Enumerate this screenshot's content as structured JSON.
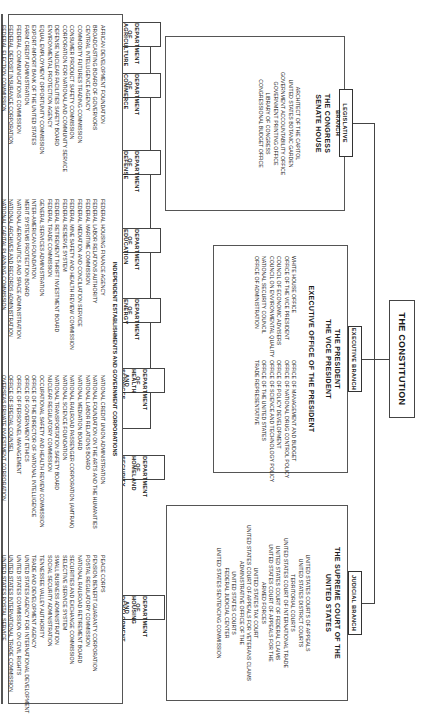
{
  "title": "THE CONSTITUTION",
  "branches": {
    "legislative": {
      "label": "LEGISLATIVE BRANCH",
      "heads": [
        "THE CONGRESS",
        "SENATE   HOUSE"
      ],
      "agencies": [
        "ARCHITECT OF THE CAPITOL",
        "UNITED STATES BOTANIC GARDEN",
        "GOVERNMENT ACCOUNTABILITY OFFICE",
        "GOVERNMENT PRINTING OFFICE",
        "LIBRARY OF CONGRESS",
        "CONGRESSIONAL BUDGET OFFICE"
      ]
    },
    "executive": {
      "label": "EXECUTIVE BRANCH",
      "heads": [
        "THE PRESIDENT",
        "THE VICE PRESIDENT"
      ],
      "eop_header": "EXECUTIVE OFFICE OF THE PRESIDENT",
      "eop_left": [
        "WHITE HOUSE OFFICE",
        "OFFICE OF THE VICE PRESIDENT",
        "COUNCIL OF ECONOMIC ADVISERS",
        "COUNCIL ON ENVIRONMENTAL QUALITY",
        "NATIONAL SECURITY COUNCIL",
        "OFFICE OF ADMINISTRATION"
      ],
      "eop_right": [
        "OFFICE OF MANAGEMENT AND BUDGET",
        "OFFICE OF NATIONAL DRUG CONTROL POLICY",
        "OFFICE OF POLICY DEVELOPMENT",
        "OFFICE OF SCIENCE AND TECHNOLOGY POLICY",
        "OFFICE OF THE UNITED STATES",
        "TRADE REPRESENTATIVE"
      ]
    },
    "judicial": {
      "label": "JUDICIAL BRANCH",
      "heads": [
        "THE SUPREME COURT OF THE",
        "UNITED STATES"
      ],
      "courts": [
        "UNITED STATES COURTS OF APPEALS",
        "UNITED STATES DISTRICT COURTS",
        "TERRITORIAL COURTS",
        "UNITED STATES COURT OF INTERNATIONAL TRADE",
        "UNITED STATES COURT OF FEDERAL CLAIMS",
        "UNITED STATES COURT OF APPEALS FOR THE",
        "ARMED FORCES",
        "UNITED STATES TAX COURT",
        "UNITED STATES COURT OF APPEALS FOR VETERANS CLAIMS",
        "ADMINISTRATIVE OFFICE OF THE",
        "UNITED STATES COURTS",
        "FEDERAL JUDICIAL CENTER",
        "UNITED STATES SENTENCING COMMISSION"
      ]
    }
  },
  "departments_row1": [
    {
      "l1": "DEPARTMENT OF",
      "l2": "AGRICULTURE"
    },
    {
      "l1": "DEPARTMENT OF",
      "l2": "COMMERCE"
    },
    {
      "l1": "DEPARTMENT OF",
      "l2": "DEFENSE"
    },
    {
      "l1": "DEPARTMENT OF",
      "l2": "EDUCATION"
    },
    {
      "l1": "DEPARTMENT OF",
      "l2": "ENERGY"
    },
    {
      "l1": "DEPARTMENT OF",
      "l2": "HEALTH AND HUMAN",
      "l3": "SERVICES"
    },
    {
      "l1": "DEPARTMENT OF",
      "l2": "HOMELAND",
      "l3": "SECURITY"
    },
    {
      "l1": "DEPARTMENT OF",
      "l2": "HOUSING AND URBAN",
      "l3": "DEVELOPMENT"
    }
  ],
  "departments_row2": [
    {
      "l1": "DEPARTMENT OF",
      "l2": "THE INTERIOR"
    },
    {
      "l1": "DEPARTMENT OF",
      "l2": "JUSTICE"
    },
    {
      "l1": "DEPARTMENT OF",
      "l2": "LABOR"
    },
    {
      "l1": "DEPARTMENT OF",
      "l2": "STATE"
    },
    {
      "l1": "DEPARTMENT OF",
      "l2": "TRANSPORTATION"
    },
    {
      "l1": "DEPARTMENT OF",
      "l2": "THE TREASURY"
    },
    {
      "l1": "DEPARTMENT OF",
      "l2": "VETERANS AFFAIRS"
    }
  ],
  "independent": {
    "header": "INDEPENDENT ESTABLISHMENTS AND GOVERNMENT CORPORATIONS",
    "col1": [
      "AFRICAN DEVELOPMENT FOUNDATION",
      "BROADCASTING BOARD OF GOVERNORS",
      "CENTRAL INTELLIGENCE AGENCY",
      "COMMODITY FUTURES TRADING COMMISSION",
      "CONSUMER PRODUCT SAFETY COMMISSION",
      "CORPORATION FOR NATIONAL AND COMMUNITY SERVICE",
      "DEFENSE NUCLEAR FACILITIES SAFETY BOARD",
      "ENVIRONMENTAL PROTECTION AGENCY",
      "EQUAL EMPLOYMENT OPPORTUNITY COMMISSION",
      "EXPORT-IMPORT BANK OF THE UNITED STATES",
      "FARM CREDIT ADMINISTRATION",
      "FEDERAL COMMUNICATIONS COMMISSION",
      "FEDERAL DEPOSIT INSURANCE CORPORATION",
      "FEDERAL ELECTION COMMISSION"
    ],
    "col2": [
      "FEDERAL HOUSING FINANCE  AGENCY",
      "FEDERAL LABOR RELATIONS AUTHORITY",
      "FEDERAL MARITIME COMMISSION",
      "FEDERAL MEDIATION AND CONCILIATION SERVICE",
      "FEDERAL MINE SAFETY AND HEALTH REVIEW COMMISSION",
      "FEDERAL RESERVE SYSTEM",
      "FEDERAL RETIREMENT THRIFT INVESTMENT BOARD",
      "FEDERAL TRADE COMMISSION",
      "GENERAL SERVICES ADMINISTRATION",
      "INTER-AMERICAN FOUNDATION",
      "MERIT SYSTEMS PROTECTION BOARD",
      "NATIONAL AERONAUTICS AND SPACE ADMINISTRATION",
      "NATIONAL ARCHIVES AND RECORDS ADMINISTRATION",
      "NATIONAL CAPITAL PLANNING COMMISSION"
    ],
    "col3": [
      "NATIONAL CREDIT UNION ADMINISTRATION",
      "NATIONAL FOUNDATION ON THE ARTS AND THE HUMANITIES",
      "NATIONAL LABOR RELATIONS BOARD",
      "NATIONAL MEDIATION BOARD",
      "NATIONAL RAILROAD PASSENGER CORPORATION (AMTRAK)",
      "NATIONAL SCIENCE FOUNDATION",
      "NATIONAL TRANSPORTATION SAFETY BOARD",
      "NUCLEAR REGULATORY COMMISSION",
      "OCCUPATIONAL SAFETY AND HEALTH REVIEW COMMISSION",
      "OFFICE OF THE DIRECTOR OF NATIONAL INTELLIGENCE",
      "OFFICE OF GOVERNMENT ETHICS",
      "OFFICE OF PERSONNEL MANAGEMENT",
      "OFFICE OF SPECIAL COUNSEL",
      "OVERSEAS PRIVATE INVESTMENT CORPORATION"
    ],
    "col4": [
      "PEACE CORPS",
      "PENSION BENEFIT GUARANTY CORPORATION",
      "POSTAL REGULATORY COMMISSION",
      "NATIONAL RAILROAD RETIREMENT BOARD",
      "SECURITIES AND EXCHANGE COMMISSION",
      "SELECTIVE SERVICE SYSTEM",
      "SMALL BUSINESS ADMINISTRATION",
      "SOCIAL SECURITY ADMINISTRATION",
      "TENNESSEE VALLEY AUTHORITY",
      "TRADE AND DEVELOPMENT AGENCY",
      "UNITED STATES AGENCY FOR INTERNATIONAL DEVELOPMENT",
      "UNITED STATES COMMISSION ON CIVIL RIGHTS",
      "UNITED STATES INTERNATIONAL TRADE COMMISSION",
      "UNITED STATES POSTAL SERVICE"
    ]
  }
}
